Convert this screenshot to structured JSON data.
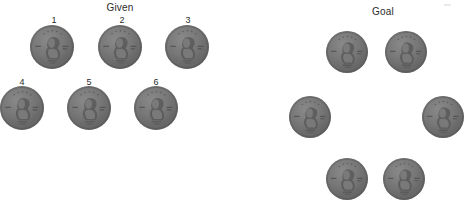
{
  "canvas": {
    "width": 468,
    "height": 206,
    "background": "#ffffff"
  },
  "panels": [
    {
      "name": "given",
      "title": "Given",
      "title_x": 120,
      "title_y": 2,
      "coin_diameter": 44,
      "coins": [
        {
          "label": "1",
          "x": 52,
          "y": 47,
          "label_x": 54,
          "label_y": 15
        },
        {
          "label": "2",
          "x": 120,
          "y": 47,
          "label_x": 122,
          "label_y": 15
        },
        {
          "label": "3",
          "x": 187,
          "y": 47,
          "label_x": 188,
          "label_y": 15
        },
        {
          "label": "4",
          "x": 22,
          "y": 108,
          "label_x": 22,
          "label_y": 77
        },
        {
          "label": "5",
          "x": 89,
          "y": 108,
          "label_x": 89,
          "label_y": 77
        },
        {
          "label": "6",
          "x": 156,
          "y": 108,
          "label_x": 156,
          "label_y": 77
        }
      ]
    },
    {
      "name": "goal",
      "title": "Goal",
      "title_x": 383,
      "title_y": 6,
      "coin_diameter": 42,
      "coins": [
        {
          "label": "",
          "x": 347,
          "y": 52
        },
        {
          "label": "",
          "x": 406,
          "y": 52
        },
        {
          "label": "",
          "x": 310,
          "y": 117
        },
        {
          "label": "",
          "x": 443,
          "y": 117
        },
        {
          "label": "",
          "x": 347,
          "y": 179
        },
        {
          "label": "",
          "x": 404,
          "y": 179
        }
      ]
    }
  ],
  "colors": {
    "coin_face": "#757575",
    "coin_rim": "#4e4e4e",
    "text": "#2b2b2b",
    "background": "#ffffff"
  },
  "icons": {
    "coin": "penny-coin-icon"
  }
}
